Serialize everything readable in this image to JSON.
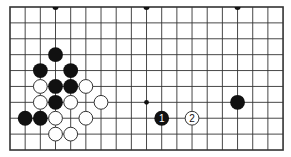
{
  "diagram": {
    "type": "go-board-fragment",
    "columns": 19,
    "rows": 10,
    "grid": {
      "x0": 10,
      "y0": 7,
      "dx": 15.17,
      "dy": 15.89
    },
    "colors": {
      "background": "#ffffff",
      "line": "#333333",
      "black_stone": "#111111",
      "white_stone": "#ffffff",
      "white_stone_edge": "#333333"
    },
    "edge_star_points": [
      {
        "col": 3,
        "row": 0
      },
      {
        "col": 9,
        "row": 0
      },
      {
        "col": 15,
        "row": 0
      }
    ],
    "star_points": [
      {
        "col": 3,
        "row": 6
      },
      {
        "col": 9,
        "row": 6
      },
      {
        "col": 15,
        "row": 6
      }
    ],
    "stones": [
      {
        "color": "black",
        "col": 3,
        "row": 3
      },
      {
        "color": "black",
        "col": 2,
        "row": 4
      },
      {
        "color": "black",
        "col": 4,
        "row": 4
      },
      {
        "color": "white",
        "col": 2,
        "row": 5
      },
      {
        "color": "black",
        "col": 3,
        "row": 5
      },
      {
        "color": "black",
        "col": 4,
        "row": 5
      },
      {
        "color": "white",
        "col": 5,
        "row": 5
      },
      {
        "color": "white",
        "col": 2,
        "row": 6
      },
      {
        "color": "black",
        "col": 3,
        "row": 6
      },
      {
        "color": "white",
        "col": 4,
        "row": 6
      },
      {
        "color": "white",
        "col": 6,
        "row": 6
      },
      {
        "color": "black",
        "col": 1,
        "row": 7
      },
      {
        "color": "black",
        "col": 2,
        "row": 7
      },
      {
        "color": "white",
        "col": 3,
        "row": 7
      },
      {
        "color": "white",
        "col": 5,
        "row": 7
      },
      {
        "color": "white",
        "col": 3,
        "row": 8
      },
      {
        "color": "white",
        "col": 4,
        "row": 8
      },
      {
        "color": "black",
        "col": 15,
        "row": 6
      },
      {
        "color": "black",
        "col": 10,
        "row": 7,
        "label": "1"
      },
      {
        "color": "white",
        "col": 12,
        "row": 7,
        "label": "2"
      }
    ]
  }
}
